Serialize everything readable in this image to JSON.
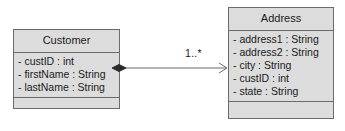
{
  "diagram": {
    "type": "uml-class-diagram",
    "background_color": "#ffffff",
    "classes": [
      {
        "id": "customer",
        "name": "Customer",
        "attributes": [
          "- custID : int",
          "- firstName : String",
          "- lastName : String"
        ],
        "operations": [],
        "fill_color": "#dcdcdc",
        "border_color": "#6b6b6b"
      },
      {
        "id": "address",
        "name": "Address",
        "attributes": [
          "- address1 : String",
          "- address2 : String",
          "- city : String",
          "- custID : int",
          "- state : String"
        ],
        "operations": [],
        "fill_color": "#dcdcdc",
        "border_color": "#6b6b6b"
      }
    ],
    "relationship": {
      "kind": "composition",
      "source": "Customer",
      "target": "Address",
      "source_decoration": "filled-diamond",
      "target_decoration": "open-arrow",
      "target_multiplicity": "1..*",
      "line_color": "#6b6b6b"
    }
  }
}
